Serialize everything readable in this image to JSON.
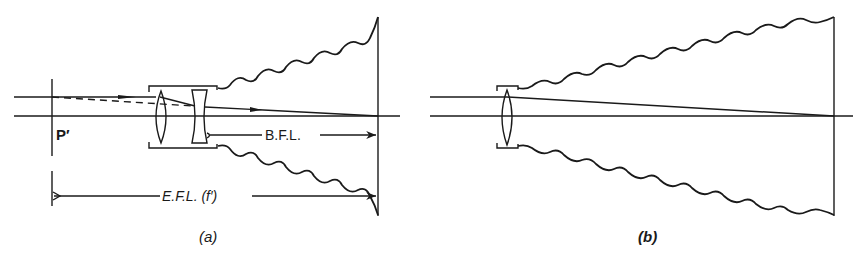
{
  "figure": {
    "panels": [
      {
        "id": "a",
        "caption": "(a)",
        "description": "Telephoto lens system (positive front lens + negative rear lens) with bellows to film plane",
        "labels": {
          "principal_plane": "P′",
          "back_focal_length": "B.F.L.",
          "effective_focal_length": "E.F.L. (f′)"
        }
      },
      {
        "id": "b",
        "caption": "(b)",
        "description": "Single positive lens with long bellows to film plane (same focal length)"
      }
    ],
    "colors": {
      "ink": "#1a1a1a",
      "background": "#ffffff"
    }
  }
}
